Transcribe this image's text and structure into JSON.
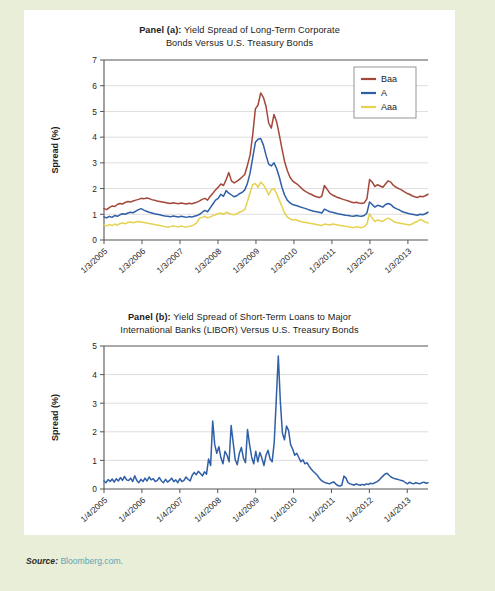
{
  "figure": {
    "source_label": "Source:",
    "source_value": "Bloomberg.com.",
    "background_color": "#e8eed8",
    "panel_color": "#ffffff"
  },
  "panel_a": {
    "title_line1_bold": "Panel (a):",
    "title_line1_rest": " Yield Spread of Long-Term Corporate",
    "title_line2": "Bonds Versus U.S. Treasury Bonds"
  },
  "panel_b": {
    "title_line1_bold": "Panel (b):",
    "title_line1_rest": " Yield Spread of Short-Term Loans to Major",
    "title_line2": "International Banks (LIBOR) Versus U.S. Treasury Bonds"
  },
  "chart_data": [
    {
      "id": "panel-a",
      "type": "line",
      "title": "Panel (a): Yield Spread of Long-Term Corporate Bonds Versus U.S. Treasury Bonds",
      "xlabel": "",
      "ylabel": "Spread (%)",
      "ylim": [
        0,
        7
      ],
      "yticks": [
        0,
        1,
        2,
        3,
        4,
        5,
        6,
        7
      ],
      "xticks": [
        "1/3/2005",
        "1/3/2006",
        "1/3/2007",
        "1/3/2008",
        "1/3/2009",
        "1/3/2010",
        "1/3/2011",
        "1/3/2012",
        "1/3/2013"
      ],
      "grid": true,
      "legend_position": "top-right",
      "series": [
        {
          "name": "Baa",
          "color": "#a4473a",
          "values": [
            1.22,
            1.18,
            1.26,
            1.32,
            1.3,
            1.38,
            1.42,
            1.4,
            1.46,
            1.5,
            1.48,
            1.52,
            1.55,
            1.58,
            1.62,
            1.6,
            1.63,
            1.61,
            1.57,
            1.55,
            1.52,
            1.5,
            1.48,
            1.46,
            1.44,
            1.42,
            1.45,
            1.43,
            1.41,
            1.44,
            1.42,
            1.4,
            1.43,
            1.41,
            1.44,
            1.47,
            1.52,
            1.58,
            1.62,
            1.55,
            1.7,
            1.82,
            1.95,
            2.05,
            2.18,
            2.12,
            2.35,
            2.62,
            2.3,
            2.22,
            2.28,
            2.36,
            2.45,
            2.55,
            2.9,
            3.3,
            4.1,
            5.1,
            5.25,
            5.72,
            5.55,
            5.2,
            4.55,
            4.35,
            4.88,
            4.6,
            4.1,
            3.55,
            3.05,
            2.7,
            2.45,
            2.3,
            2.22,
            2.15,
            2.05,
            1.95,
            1.88,
            1.82,
            1.78,
            1.72,
            1.68,
            1.65,
            1.7,
            2.12,
            1.98,
            1.82,
            1.75,
            1.7,
            1.65,
            1.62,
            1.58,
            1.55,
            1.52,
            1.48,
            1.45,
            1.47,
            1.44,
            1.42,
            1.45,
            1.6,
            2.35,
            2.25,
            2.08,
            2.15,
            2.1,
            2.05,
            2.18,
            2.3,
            2.25,
            2.12,
            2.05,
            2.0,
            1.95,
            1.88,
            1.82,
            1.78,
            1.72,
            1.68,
            1.65,
            1.7,
            1.68,
            1.72,
            1.78
          ]
        },
        {
          "name": "A",
          "color": "#2f5fa6",
          "values": [
            0.9,
            0.86,
            0.92,
            0.88,
            0.95,
            0.92,
            0.98,
            1.02,
            1.0,
            1.05,
            1.08,
            1.06,
            1.12,
            1.18,
            1.22,
            1.16,
            1.12,
            1.08,
            1.05,
            1.02,
            1.0,
            0.98,
            0.95,
            0.93,
            0.92,
            0.9,
            0.93,
            0.91,
            0.89,
            0.92,
            0.9,
            0.88,
            0.91,
            0.89,
            0.92,
            0.95,
            1.0,
            1.08,
            1.15,
            1.1,
            1.25,
            1.4,
            1.55,
            1.62,
            1.78,
            1.7,
            1.92,
            1.82,
            1.75,
            1.68,
            1.72,
            1.8,
            1.85,
            1.95,
            2.2,
            2.6,
            3.2,
            3.8,
            3.92,
            3.95,
            3.7,
            3.3,
            2.95,
            2.88,
            3.0,
            2.78,
            2.45,
            2.05,
            1.75,
            1.55,
            1.45,
            1.38,
            1.35,
            1.32,
            1.28,
            1.25,
            1.22,
            1.18,
            1.15,
            1.12,
            1.1,
            1.08,
            1.05,
            1.2,
            1.15,
            1.1,
            1.08,
            1.05,
            1.02,
            1.0,
            0.98,
            0.96,
            0.95,
            0.93,
            0.92,
            0.95,
            0.93,
            0.92,
            0.95,
            1.05,
            1.48,
            1.38,
            1.28,
            1.35,
            1.32,
            1.28,
            1.38,
            1.42,
            1.38,
            1.28,
            1.22,
            1.18,
            1.12,
            1.08,
            1.05,
            1.02,
            1.0,
            0.98,
            0.96,
            1.0,
            0.98,
            1.02,
            1.08
          ]
        },
        {
          "name": "Aaa",
          "color": "#e5d24e",
          "values": [
            0.58,
            0.55,
            0.6,
            0.56,
            0.62,
            0.58,
            0.64,
            0.66,
            0.63,
            0.68,
            0.7,
            0.67,
            0.7,
            0.72,
            0.7,
            0.68,
            0.66,
            0.64,
            0.62,
            0.6,
            0.58,
            0.56,
            0.54,
            0.52,
            0.5,
            0.52,
            0.55,
            0.53,
            0.51,
            0.54,
            0.52,
            0.5,
            0.53,
            0.55,
            0.6,
            0.68,
            0.85,
            0.88,
            0.92,
            0.86,
            0.9,
            0.95,
            0.98,
            1.02,
            1.05,
            1.0,
            1.08,
            1.04,
            1.0,
            0.98,
            1.02,
            1.08,
            1.12,
            1.18,
            1.5,
            1.85,
            2.15,
            2.2,
            2.05,
            2.25,
            2.15,
            1.98,
            1.75,
            1.95,
            2.0,
            1.8,
            1.55,
            1.3,
            1.05,
            0.9,
            0.82,
            0.78,
            0.8,
            0.76,
            0.72,
            0.7,
            0.68,
            0.66,
            0.64,
            0.62,
            0.6,
            0.58,
            0.56,
            0.62,
            0.6,
            0.58,
            0.62,
            0.6,
            0.58,
            0.56,
            0.55,
            0.53,
            0.52,
            0.5,
            0.48,
            0.52,
            0.5,
            0.48,
            0.52,
            0.62,
            1.02,
            0.85,
            0.72,
            0.78,
            0.75,
            0.72,
            0.8,
            0.85,
            0.8,
            0.72,
            0.68,
            0.66,
            0.64,
            0.62,
            0.6,
            0.58,
            0.62,
            0.68,
            0.72,
            0.8,
            0.76,
            0.7,
            0.66
          ]
        }
      ]
    },
    {
      "id": "panel-b",
      "type": "line",
      "title": "Panel (b): Yield Spread of Short-Term Loans to Major International Banks (LIBOR) Versus U.S. Treasury Bonds",
      "xlabel": "",
      "ylabel": "Spread (%)",
      "ylim": [
        0,
        5
      ],
      "yticks": [
        0,
        1,
        2,
        3,
        4,
        5
      ],
      "xticks": [
        "1/4/2005",
        "1/4/2006",
        "1/4/2007",
        "1/4/2008",
        "1/4/2009",
        "1/4/2010",
        "1/4/2011",
        "1/4/2012",
        "1/4/2013"
      ],
      "grid": true,
      "legend_position": "none",
      "series": [
        {
          "name": "LIBOR spread",
          "color": "#2f5fa6",
          "values": [
            0.28,
            0.22,
            0.33,
            0.26,
            0.35,
            0.24,
            0.36,
            0.28,
            0.4,
            0.3,
            0.44,
            0.32,
            0.3,
            0.38,
            0.26,
            0.46,
            0.3,
            0.22,
            0.34,
            0.26,
            0.38,
            0.28,
            0.42,
            0.32,
            0.36,
            0.26,
            0.3,
            0.4,
            0.28,
            0.22,
            0.34,
            0.24,
            0.3,
            0.38,
            0.26,
            0.32,
            0.22,
            0.36,
            0.26,
            0.3,
            0.42,
            0.34,
            0.28,
            0.48,
            0.58,
            0.5,
            0.62,
            0.54,
            0.46,
            0.6,
            0.52,
            1.05,
            0.82,
            2.38,
            1.55,
            1.25,
            1.48,
            1.1,
            0.88,
            1.32,
            1.18,
            0.95,
            2.22,
            1.62,
            1.02,
            0.85,
            1.25,
            1.45,
            1.08,
            0.92,
            2.08,
            1.55,
            1.12,
            0.88,
            1.32,
            0.95,
            1.28,
            1.08,
            0.82,
            1.18,
            1.35,
            1.05,
            0.95,
            1.62,
            3.1,
            4.65,
            3.05,
            1.95,
            1.72,
            2.2,
            2.05,
            1.55,
            1.4,
            1.18,
            1.25,
            1.1,
            0.95,
            1.02,
            0.88,
            0.92,
            0.8,
            0.7,
            0.62,
            0.55,
            0.48,
            0.38,
            0.3,
            0.25,
            0.22,
            0.2,
            0.18,
            0.22,
            0.25,
            0.18,
            0.12,
            0.1,
            0.14,
            0.45,
            0.38,
            0.22,
            0.18,
            0.16,
            0.14,
            0.18,
            0.15,
            0.13,
            0.16,
            0.14,
            0.18,
            0.16,
            0.2,
            0.18,
            0.22,
            0.25,
            0.3,
            0.38,
            0.45,
            0.52,
            0.55,
            0.48,
            0.42,
            0.38,
            0.36,
            0.34,
            0.32,
            0.3,
            0.28,
            0.22,
            0.18,
            0.24,
            0.2,
            0.18,
            0.22,
            0.2,
            0.18,
            0.22,
            0.24,
            0.2,
            0.22
          ]
        }
      ]
    }
  ]
}
